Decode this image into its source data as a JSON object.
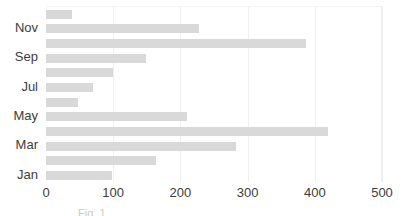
{
  "chart_data": {
    "type": "bar",
    "orientation": "horizontal",
    "title": "",
    "subtitle": "",
    "xlabel": "",
    "ylabel": "",
    "xlim": [
      0,
      500
    ],
    "ylim": null,
    "grid": true,
    "legend": null,
    "legend_position": "none",
    "bar_color": "#d9d9d9",
    "categories": [
      "Jan",
      "Feb",
      "Mar",
      "Apr",
      "May",
      "Jun",
      "Jul",
      "Aug",
      "Sep",
      "Oct",
      "Nov",
      "Dec"
    ],
    "values": [
      98,
      163,
      282,
      420,
      210,
      48,
      70,
      100,
      149,
      387,
      227,
      39
    ],
    "x_ticks": [
      0,
      100,
      200,
      300,
      400,
      500
    ],
    "x_tick_labels": [
      "0",
      "100",
      "200",
      "300",
      "400",
      "500"
    ],
    "y_tick_labels_visible": [
      "Jan",
      "Mar",
      "May",
      "Jul",
      "Sep",
      "Nov"
    ],
    "annotations": []
  },
  "axes": {
    "x_ticks": [
      {
        "label": "0",
        "value": 0
      },
      {
        "label": "100",
        "value": 100
      },
      {
        "label": "200",
        "value": 200
      },
      {
        "label": "300",
        "value": 300
      },
      {
        "label": "400",
        "value": 400
      },
      {
        "label": "500",
        "value": 500
      }
    ],
    "y_ticks": [
      {
        "label": "Jan",
        "index": 0
      },
      {
        "label": "Mar",
        "index": 2
      },
      {
        "label": "May",
        "index": 4
      },
      {
        "label": "Jul",
        "index": 6
      },
      {
        "label": "Sep",
        "index": 8
      },
      {
        "label": "Nov",
        "index": 10
      }
    ]
  },
  "caption": {
    "text": "Fig. 1"
  }
}
